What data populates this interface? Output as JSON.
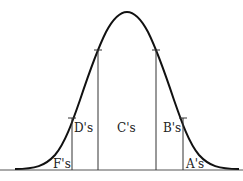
{
  "diagram": {
    "type": "normal-distribution-grade-regions",
    "labels": {
      "f": "F's",
      "d": "D's",
      "c": "C's",
      "b": "B's",
      "a": "A's"
    },
    "colors": {
      "curve": "#111111",
      "lines": "#333333",
      "background": "#ffffff"
    }
  }
}
